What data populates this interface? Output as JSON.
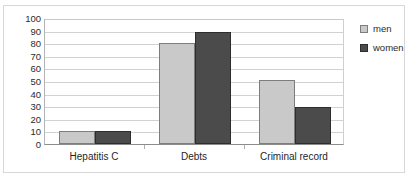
{
  "chart_data": {
    "type": "bar",
    "title": "",
    "subtitle": "",
    "xlabel": "",
    "ylabel": "",
    "categories": [
      "Hepatitis C",
      "Debts",
      "Criminal record"
    ],
    "series": [
      {
        "name": "men",
        "color": "#c9c9c9",
        "values": [
          10,
          80,
          51
        ]
      },
      {
        "name": "women",
        "color": "#4b4b4b",
        "values": [
          10,
          89,
          29
        ]
      }
    ],
    "ylim": [
      0,
      100
    ],
    "ytick_step": 10,
    "yticks": [
      100,
      90,
      80,
      70,
      60,
      50,
      40,
      30,
      20,
      10,
      0
    ],
    "grid": "horizontal",
    "legend_position": "right"
  },
  "legend": {
    "entries": [
      {
        "label": "men"
      },
      {
        "label": "women"
      }
    ]
  },
  "axes": {
    "y_tick_labels": [
      "100",
      "90",
      "80",
      "70",
      "60",
      "50",
      "40",
      "30",
      "20",
      "10",
      "0"
    ],
    "x_tick_labels": [
      "Hepatitis C",
      "Debts",
      "Criminal record"
    ]
  }
}
